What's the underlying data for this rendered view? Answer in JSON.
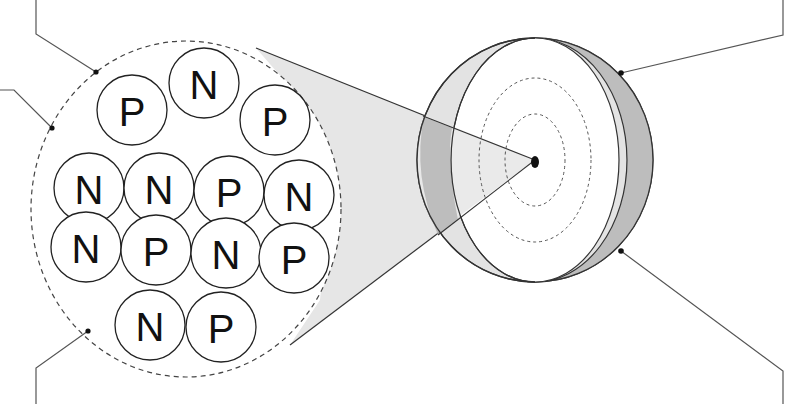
{
  "diagram": {
    "title": "",
    "colors": {
      "background": "#ffffff",
      "outline": "#333333",
      "shell_light": "#e6e6e6",
      "shell_dark": "#bdbdbd",
      "overlap": "#aaaaaa",
      "magnify_cone": "#e4e4e4",
      "leader_line": "#555555"
    },
    "nucleus_zoom": {
      "particles": [
        {
          "label": "P",
          "row": 1,
          "col": 1
        },
        {
          "label": "N",
          "row": 1,
          "col": 2
        },
        {
          "label": "P",
          "row": 1,
          "col": 3
        },
        {
          "label": "N",
          "row": 2,
          "col": 1
        },
        {
          "label": "N",
          "row": 2,
          "col": 2
        },
        {
          "label": "P",
          "row": 2,
          "col": 3
        },
        {
          "label": "N",
          "row": 2,
          "col": 4
        },
        {
          "label": "N",
          "row": 3,
          "col": 1
        },
        {
          "label": "P",
          "row": 3,
          "col": 2
        },
        {
          "label": "N",
          "row": 3,
          "col": 3
        },
        {
          "label": "P",
          "row": 3,
          "col": 4
        },
        {
          "label": "N",
          "row": 4,
          "col": 1
        },
        {
          "label": "P",
          "row": 4,
          "col": 2
        }
      ],
      "counts": {
        "protons": 6,
        "neutrons": 7
      }
    },
    "leader_lines": [
      {
        "name": "leader-top-left-upper",
        "target": "nucleus boundary",
        "label": ""
      },
      {
        "name": "leader-top-left-lower",
        "target": "nucleus boundary",
        "label": ""
      },
      {
        "name": "leader-bottom-left",
        "target": "nucleus boundary",
        "label": ""
      },
      {
        "name": "leader-top-right",
        "target": "electron cloud edge",
        "label": ""
      },
      {
        "name": "leader-bottom-right",
        "target": "electron cloud edge",
        "label": ""
      }
    ]
  }
}
